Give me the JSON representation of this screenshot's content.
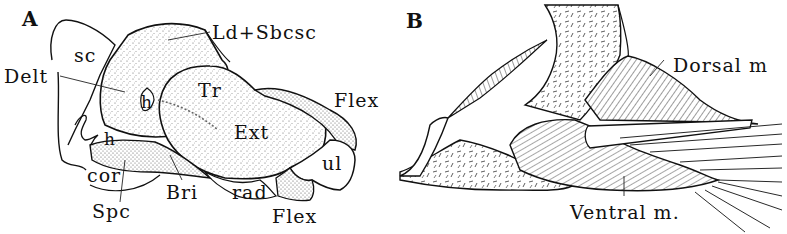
{
  "figure": {
    "panels": [
      {
        "id": "A",
        "letter": "A",
        "labels": {
          "ld_sbcsc": "Ld+Sbcsc",
          "sc": "sc",
          "delt": "Delt",
          "tr": "Tr",
          "h_upper": "h",
          "h_lower": "h",
          "ext": "Ext",
          "flex_upper": "Flex",
          "flex_lower": "Flex",
          "ul": "ul",
          "cor": "cor",
          "bri": "Bri",
          "rad": "rad",
          "spc": "Spc"
        }
      },
      {
        "id": "B",
        "letter": "B",
        "labels": {
          "dorsal": "Dorsal m",
          "ventral": "Ventral m."
        }
      }
    ],
    "colors": {
      "ink": "#111111",
      "stipple": "#555555",
      "background": "#ffffff"
    }
  }
}
